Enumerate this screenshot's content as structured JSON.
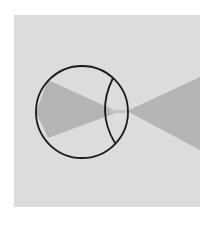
{
  "diagram": {
    "colors": {
      "background": "#ffffff",
      "panel": "#dcdcdc",
      "light_cone": "#b4b4b4",
      "outline": "#1a1a1a"
    },
    "eyeball": {
      "cx": 82,
      "cy": 112,
      "r": 46
    },
    "lens": {
      "left_x": 104,
      "right_x": 127,
      "top_y": 78,
      "bottom_y": 144
    },
    "focal_point": {
      "x": 118,
      "y": 112
    },
    "outer_cone": {
      "apex_x": 127,
      "apex_y": 111,
      "end_x": 200,
      "top_y": 77,
      "bottom_y": 150
    },
    "inner_cone": {
      "start_x": 36,
      "top_y": 80,
      "bottom_y": 138
    }
  }
}
